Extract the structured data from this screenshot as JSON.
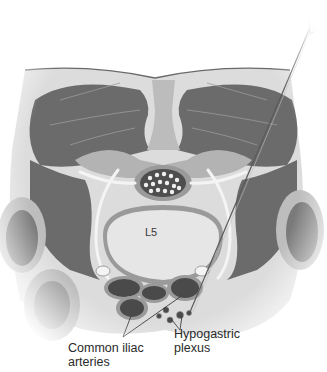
{
  "figure": {
    "colors": {
      "background": "#ffffff",
      "muscle": "#6b6b6b",
      "fascia": "#d8d8d8",
      "bone": "#e8e8e8",
      "vessel_dark": "#4a4a4a",
      "vessel_rim": "#9a9a9a",
      "nerve": "#f4f4f4",
      "needle": "#5a5a5a",
      "text": "#2a2a2a"
    }
  },
  "labels": {
    "vertebra": "L5",
    "common_iliac_line1": "Common iliac",
    "common_iliac_line2": "arteries",
    "hypogastric_line1": "Hypogastric",
    "hypogastric_line2": "plexus"
  }
}
